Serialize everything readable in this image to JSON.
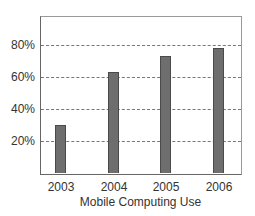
{
  "chart_data": {
    "type": "bar",
    "title": "",
    "xlabel": "Mobile Computing Use",
    "ylabel": "",
    "categories": [
      "2003",
      "2004",
      "2005",
      "2006"
    ],
    "values": [
      30,
      63,
      73,
      78
    ],
    "yticks": [
      "20%",
      "40%",
      "60%",
      "80%"
    ],
    "ytick_values": [
      20,
      40,
      60,
      80
    ],
    "ylim": [
      0,
      98
    ],
    "grid": true,
    "grid_style": "dotted horizontal",
    "legend": null,
    "colors": {
      "bar_fill": "#6e6e6e",
      "bar_border": "#4a4a4a",
      "axis": "#666666",
      "grid": "#777777"
    }
  }
}
